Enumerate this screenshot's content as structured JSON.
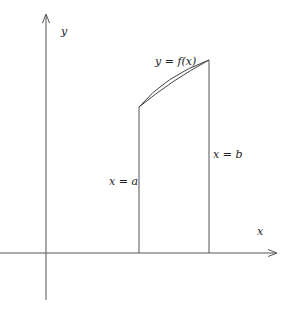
{
  "diagram": {
    "title": "",
    "colors": {
      "background": "#ffffff",
      "axis": "#555555",
      "lines": "#555555",
      "curve": "#444444",
      "text": "#222222"
    },
    "axes": {
      "x_label": "x",
      "y_label": "y"
    },
    "labels": {
      "function": "y = f(x)",
      "left_bound": "x = a",
      "right_bound": "x = b"
    }
  }
}
